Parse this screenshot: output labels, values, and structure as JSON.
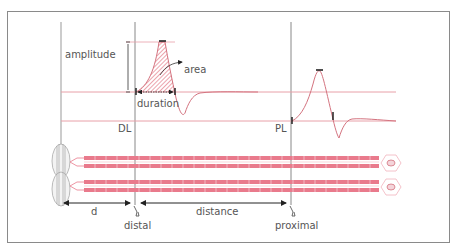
{
  "diagram": {
    "colors": {
      "frame": "#8a8a8a",
      "baseline": "#e8a0a8",
      "waveform": "#d4737f",
      "fiber": "#e97a8c",
      "fiber_dark": "#d45e72",
      "hatch": "#d94a5c",
      "text": "#555555",
      "arrow": "#222222",
      "guide": "#777777"
    },
    "labels": {
      "amplitude": "amplitude",
      "area": "area",
      "duration": "duration",
      "dl": "DL",
      "pl": "PL",
      "d": "d",
      "distance": "distance",
      "distal": "distal",
      "proximal": "proximal"
    },
    "markers": {
      "distal_latency_line_x": 135,
      "proximal_latency_line_x": 291,
      "recording_electrode_x": 61
    }
  }
}
